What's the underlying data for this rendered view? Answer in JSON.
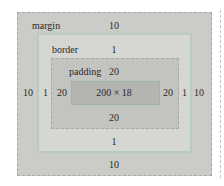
{
  "diagram": {
    "colors": {
      "margin_bg": "#cbcbc8",
      "border_bg": "#d6d6d3",
      "border_line": "#b8cbc2",
      "padding_bg": "#c3c3c0",
      "content_bg": "#b4b4b1"
    },
    "margin": {
      "label": "margin",
      "top": "10",
      "right": "10",
      "bottom": "10",
      "left": "10"
    },
    "border": {
      "label": "border",
      "top": "1",
      "right": "1",
      "bottom": "1",
      "left": "1"
    },
    "padding": {
      "label": "padding",
      "top": "20",
      "right": "20",
      "bottom": "20",
      "left": "20"
    },
    "content": {
      "size": "200 × 18"
    }
  }
}
